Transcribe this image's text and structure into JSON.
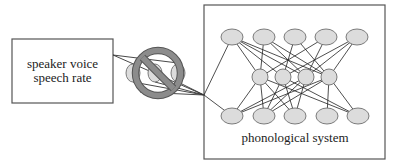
{
  "left_box": {
    "line1": "speaker voice",
    "line2": "speech rate"
  },
  "prohibition_sign": {
    "icon": "prohibition-icon",
    "color": "#8c8c8c"
  },
  "network": {
    "label": "phonological system",
    "layers": [
      {
        "name": "input",
        "count": 5
      },
      {
        "name": "hidden",
        "count": 4
      },
      {
        "name": "output",
        "count": 5
      }
    ],
    "node_fill": "#dcdcdc",
    "node_stroke": "#6e6e6e"
  }
}
